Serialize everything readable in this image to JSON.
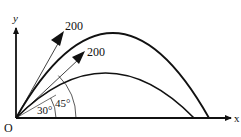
{
  "diagram": {
    "type": "projectile-trajectories",
    "origin_label": "O",
    "x_axis_label": "x",
    "y_axis_label": "y",
    "launch_vectors": [
      {
        "speed_label": "200",
        "angle_label": "45°"
      },
      {
        "speed_label": "200",
        "angle_label": "30°"
      }
    ],
    "trajectories": [
      {
        "launch_angle": "45°",
        "description": "higher, longer-range parabola"
      },
      {
        "launch_angle": "30°",
        "description": "lower, shorter-range parabola"
      }
    ],
    "colors": {
      "stroke": "#111111",
      "background": "#ffffff"
    }
  }
}
